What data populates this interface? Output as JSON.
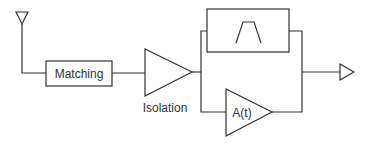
{
  "diagram": {
    "type": "rf-receiver-block-diagram",
    "blocks": {
      "antenna": {
        "label": ""
      },
      "matching": {
        "label": "Matching"
      },
      "isolation_amp": {
        "label": "Isolation"
      },
      "bandpass_filter": {
        "label": ""
      },
      "variable_amp": {
        "label": "A(t)"
      },
      "output": {
        "label": ""
      }
    },
    "colors": {
      "stroke": "#333333",
      "background": "#ffffff"
    }
  }
}
